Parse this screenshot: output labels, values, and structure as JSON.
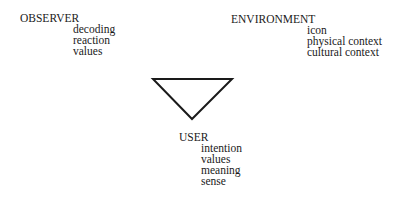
{
  "diagram": {
    "observer": {
      "label": "OBSERVER",
      "items": [
        "decoding",
        "reaction",
        "values"
      ]
    },
    "environment": {
      "label": "ENVIRONMENT",
      "items": [
        "icon",
        "physical context",
        "cultural context"
      ]
    },
    "user": {
      "label": "USER",
      "items": [
        "intention",
        "values",
        "meaning",
        "sense"
      ]
    },
    "triangle": {
      "shape": "inverted-triangle",
      "color": "#1a1a1a"
    }
  }
}
